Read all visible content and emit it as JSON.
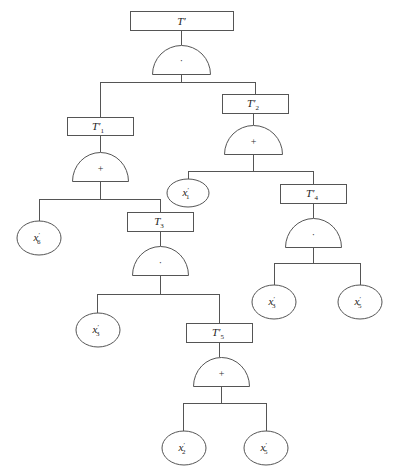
{
  "diagram": {
    "type": "fault-tree",
    "colors": {
      "stroke": "#555555",
      "text": "#222222",
      "background": "#ffffff"
    },
    "events": {
      "top": {
        "base": "T",
        "prime": "′",
        "sub": ""
      },
      "t1": {
        "base": "T",
        "prime": "′",
        "sub": "1"
      },
      "t2": {
        "base": "T",
        "prime": "′",
        "sub": "2"
      },
      "t3": {
        "base": "T",
        "prime": "",
        "sub": "3"
      },
      "t4": {
        "base": "T",
        "prime": "′",
        "sub": "4"
      },
      "t5": {
        "base": "T",
        "prime": "′",
        "sub": "5"
      }
    },
    "gates": {
      "g_top": {
        "type": "AND",
        "symbol": "·"
      },
      "g_t1": {
        "type": "OR",
        "symbol": "+"
      },
      "g_t2": {
        "type": "OR",
        "symbol": "+"
      },
      "g_t3": {
        "type": "AND",
        "symbol": "·"
      },
      "g_t4": {
        "type": "AND",
        "symbol": "·"
      },
      "g_t5": {
        "type": "OR",
        "symbol": "+"
      }
    },
    "basic_events": {
      "x6": {
        "base": "x",
        "prime": "′",
        "sub": "6"
      },
      "x1": {
        "base": "x",
        "prime": "′",
        "sub": "1"
      },
      "x3a": {
        "base": "x",
        "prime": "′",
        "sub": "3"
      },
      "x3b": {
        "base": "x",
        "prime": "′",
        "sub": "3"
      },
      "x5a": {
        "base": "x",
        "prime": "′",
        "sub": "5"
      },
      "x2": {
        "base": "x",
        "prime": "′",
        "sub": "2"
      },
      "x5b": {
        "base": "x",
        "prime": "′",
        "sub": "5"
      }
    }
  }
}
